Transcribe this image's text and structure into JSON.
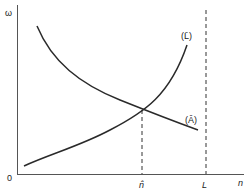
{
  "diagram": {
    "type": "economic-diagram",
    "axes": {
      "y_label": "ω",
      "x_label": "n",
      "origin_label": "0"
    },
    "curves": [
      {
        "id": "L-bar",
        "label": "(L̄)",
        "shape": "upward-convex",
        "description": "rising curve"
      },
      {
        "id": "A-hat",
        "label": "(Â)",
        "shape": "downward",
        "description": "falling curve"
      }
    ],
    "markers": [
      {
        "id": "n-hat",
        "label": "n̂",
        "style": "dashed-vertical",
        "note": "at intersection of curves"
      },
      {
        "id": "L",
        "label": "L",
        "style": "dashed-vertical",
        "note": "full-height bound"
      }
    ],
    "colors": {
      "line": "#2a2a2a",
      "background": "#ffffff"
    }
  }
}
